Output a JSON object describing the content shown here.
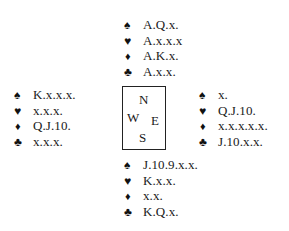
{
  "icons": {
    "spade": "♠",
    "heart": "♥",
    "diamond": "♦",
    "club": "♣"
  },
  "compass": {
    "n": "N",
    "w": "W",
    "e": "E",
    "s": "S"
  },
  "hands": {
    "north": {
      "spades": "A.Q.x.",
      "hearts": "A.x.x.x",
      "diamonds": "A.K.x.",
      "clubs": "A.x.x."
    },
    "west": {
      "spades": "K.x.x.x.",
      "hearts": "x.x.x.",
      "diamonds": "Q.J.10.",
      "clubs": "x.x.x."
    },
    "east": {
      "spades": "x.",
      "hearts": "Q.J.10.",
      "diamonds": "x.x.x.x.x.",
      "clubs": "J.10.x.x."
    },
    "south": {
      "spades": "J.10.9.x.x.",
      "hearts": "K.x.x.",
      "diamonds": "x.x.",
      "clubs": "K.Q.x."
    }
  }
}
